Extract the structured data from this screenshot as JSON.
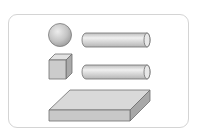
{
  "figure": {
    "shapes": [
      {
        "name": "sphere",
        "label": "sphere"
      },
      {
        "name": "cylinder-top",
        "label": "cylinder"
      },
      {
        "name": "cube",
        "label": "cube"
      },
      {
        "name": "cylinder-bottom",
        "label": "cylinder"
      },
      {
        "name": "slab",
        "label": "rectangular prism"
      }
    ],
    "colors": {
      "frame_border": "#d4d4d4",
      "stroke": "#6f6f6f",
      "fill_light": "#e4e4e4",
      "fill_mid": "#cfcfcf",
      "fill_dark": "#a9a9a9"
    }
  }
}
